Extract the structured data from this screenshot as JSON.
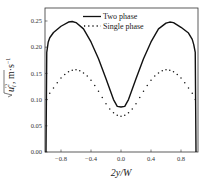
{
  "chart_data": {
    "type": "line",
    "title": "",
    "xlabel": "2y/W",
    "ylabel": "sqrt(u_i'^2), m·s^-1",
    "xlim": [
      -1.0,
      1.0
    ],
    "ylim": [
      0.0,
      0.27
    ],
    "xticks": [
      -0.8,
      -0.4,
      0.0,
      0.4,
      0.8
    ],
    "xtick_labels": [
      "-0.8",
      "-0.4",
      "0.0",
      "0.4",
      "0.8"
    ],
    "yticks": [
      0.0,
      0.05,
      0.1,
      0.15,
      0.2,
      0.25
    ],
    "ytick_labels": [
      "0.00",
      "0.05",
      "0.10",
      "0.15",
      "0.20",
      "0.25"
    ],
    "grid": false,
    "legend_position": "upper center",
    "series": [
      {
        "name": "Two phase",
        "style": "solid",
        "x": [
          -1.0,
          -0.99,
          -0.97,
          -0.95,
          -0.9,
          -0.8,
          -0.7,
          -0.65,
          -0.6,
          -0.5,
          -0.4,
          -0.3,
          -0.2,
          -0.1,
          -0.05,
          0.0,
          0.05,
          0.1,
          0.2,
          0.3,
          0.4,
          0.5,
          0.6,
          0.65,
          0.7,
          0.8,
          0.9,
          0.95,
          0.97,
          0.99,
          1.0
        ],
        "values": [
          0.0,
          0.19,
          0.21,
          0.218,
          0.228,
          0.24,
          0.248,
          0.249,
          0.247,
          0.235,
          0.21,
          0.178,
          0.14,
          0.1,
          0.087,
          0.086,
          0.087,
          0.1,
          0.14,
          0.178,
          0.21,
          0.235,
          0.246,
          0.248,
          0.247,
          0.238,
          0.227,
          0.215,
          0.205,
          0.19,
          0.0
        ]
      },
      {
        "name": "Single phase",
        "style": "dotted",
        "x": [
          -0.99,
          -0.95,
          -0.9,
          -0.85,
          -0.8,
          -0.75,
          -0.7,
          -0.65,
          -0.6,
          -0.55,
          -0.5,
          -0.45,
          -0.4,
          -0.35,
          -0.3,
          -0.25,
          -0.2,
          -0.15,
          -0.1,
          -0.05,
          0.0,
          0.05,
          0.1,
          0.15,
          0.2,
          0.25,
          0.3,
          0.35,
          0.4,
          0.45,
          0.5,
          0.55,
          0.6,
          0.65,
          0.7,
          0.75,
          0.8,
          0.85,
          0.9,
          0.95,
          0.99
        ],
        "values": [
          0.1,
          0.112,
          0.122,
          0.132,
          0.141,
          0.148,
          0.153,
          0.156,
          0.157,
          0.155,
          0.151,
          0.145,
          0.137,
          0.127,
          0.116,
          0.104,
          0.092,
          0.082,
          0.075,
          0.07,
          0.068,
          0.07,
          0.075,
          0.082,
          0.092,
          0.104,
          0.116,
          0.127,
          0.137,
          0.145,
          0.151,
          0.155,
          0.157,
          0.156,
          0.153,
          0.148,
          0.141,
          0.132,
          0.122,
          0.112,
          0.1
        ]
      }
    ]
  },
  "legend": {
    "items": [
      {
        "label": "Two phase",
        "style": "solid"
      },
      {
        "label": "Single phase",
        "style": "dotted"
      }
    ]
  },
  "axes": {
    "xlabel": "2y/W",
    "ylabel_main": "u",
    "ylabel_sub": "i",
    "ylabel_sup": "'2",
    "ylabel_units": ", m·s",
    "ylabel_units_sup": "−1"
  },
  "colors": {
    "line": "#111111",
    "axis": "#333333",
    "background": "#ffffff"
  }
}
